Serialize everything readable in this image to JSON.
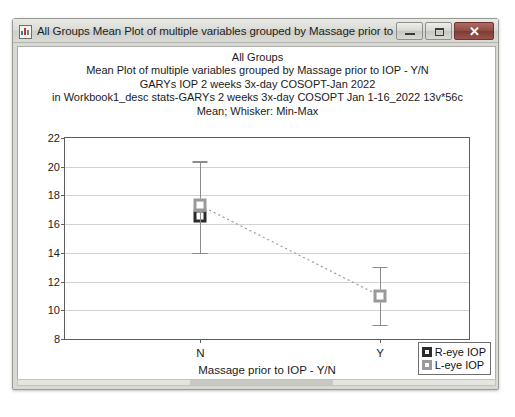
{
  "window": {
    "title": "All Groups Mean Plot of multiple variables grouped by  Massage prior to IOP - Y/N*",
    "icon": "statistica-graph-icon",
    "minimize_label": "Minimize",
    "maximize_label": "Maximize",
    "close_label": "✕"
  },
  "chart_data": {
    "type": "scatter",
    "title_lines": [
      "All Groups",
      "Mean Plot of multiple variables grouped by  Massage prior to IOP - Y/N",
      "GARYs IOP 2 weeks 3x-day COSOPT-Jan 2022",
      "in Workbook1_desc stats-GARYs 2 weeks 3x-day COSOPT Jan 1-16_2022 13v*56c",
      "Mean; Whisker: Min-Max"
    ],
    "title": "All Groups Mean Plot of multiple variables grouped by Massage prior to IOP - Y/N",
    "xlabel": "Massage prior to IOP - Y/N",
    "ylabel": "",
    "categories": [
      "N",
      "Y"
    ],
    "ylim": [
      8,
      22
    ],
    "yticks": [
      8,
      10,
      12,
      14,
      16,
      18,
      20,
      22
    ],
    "grid": true,
    "legend_position": "bottom-right",
    "whisker_type": "Min-Max",
    "center_statistic": "Mean",
    "series": [
      {
        "name": "R-eye IOP",
        "marker": "open-square-dark",
        "color": "#2b2b2b",
        "points": [
          {
            "category": "N",
            "mean": 16.6,
            "min": 14.0,
            "max": 20.3
          }
        ]
      },
      {
        "name": "L-eye IOP",
        "marker": "open-square-gray",
        "color": "#9a9a9a",
        "connector": "dotted",
        "points": [
          {
            "category": "N",
            "mean": 17.3,
            "min": 14.0,
            "max": 20.4
          },
          {
            "category": "Y",
            "mean": 11.0,
            "min": 9.0,
            "max": 13.0
          }
        ]
      }
    ]
  },
  "scrollbar": {
    "orientation": "horizontal"
  }
}
